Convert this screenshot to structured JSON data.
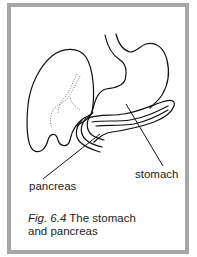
{
  "figure": {
    "labels": {
      "pancreas": "pancreas",
      "stomach": "stomach"
    },
    "caption": {
      "fig_number": "Fig. 6.4",
      "line1_rest": " The stomach",
      "line2": "and pancreas"
    },
    "colors": {
      "border": "#a6a6a6",
      "line": "#111111",
      "background": "#ffffff"
    }
  }
}
